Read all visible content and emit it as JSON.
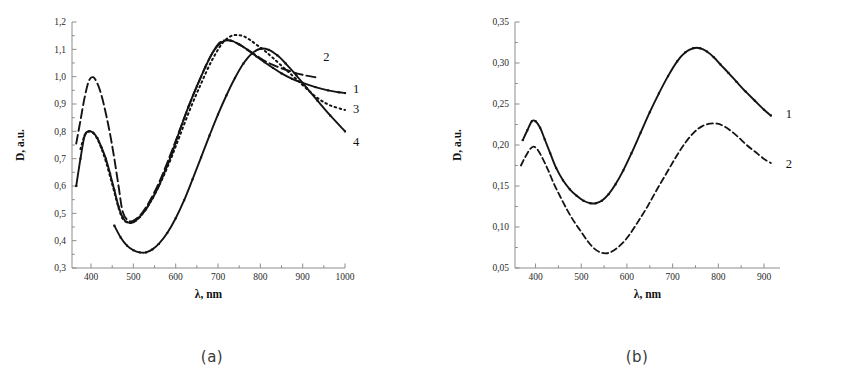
{
  "figure": {
    "panels": [
      {
        "caption": "(a)",
        "chart_data": {
          "type": "line",
          "title": "",
          "xlabel": "λ, nm",
          "ylabel": "D, a.u.",
          "xlim": [
            355,
            1000
          ],
          "ylim": [
            0.3,
            1.2
          ],
          "xticks": [
            400,
            500,
            600,
            700,
            800,
            900,
            1000
          ],
          "xticklabels": [
            "400",
            "500",
            "600",
            "700",
            "800",
            "900",
            "1000"
          ],
          "yticks": [
            0.3,
            0.4,
            0.5,
            0.6,
            0.7,
            0.8,
            0.9,
            1.0,
            1.1,
            1.2
          ],
          "yticklabels": [
            "0,3",
            "0,4",
            "0,5",
            "0,6",
            "0,7",
            "0,8",
            "0,9",
            "1,0",
            "1,1",
            "1,2"
          ],
          "grid": false,
          "legend_position": "right-of-curve-ends",
          "series": [
            {
              "name": "1",
              "label": "1",
              "style": "solid-markers",
              "label_x": 1000,
              "label_y": 0.955,
              "x": [
                365,
                375,
                385,
                395,
                405,
                415,
                425,
                435,
                445,
                455,
                465,
                475,
                485,
                500,
                515,
                530,
                545,
                560,
                575,
                590,
                610,
                630,
                650,
                670,
                690,
                710,
                730,
                750,
                770,
                790,
                810,
                830,
                850,
                875,
                900,
                930,
                960,
                985,
                1000
              ],
              "y": [
                0.6,
                0.7,
                0.785,
                0.8,
                0.795,
                0.775,
                0.74,
                0.7,
                0.645,
                0.585,
                0.525,
                0.485,
                0.468,
                0.468,
                0.487,
                0.515,
                0.555,
                0.6,
                0.655,
                0.715,
                0.805,
                0.89,
                0.965,
                1.035,
                1.095,
                1.127,
                1.132,
                1.118,
                1.098,
                1.075,
                1.053,
                1.032,
                1.012,
                0.992,
                0.977,
                0.962,
                0.95,
                0.943,
                0.94
              ]
            },
            {
              "name": "2",
              "label": "2",
              "style": "dashed-long",
              "label_x": 930,
              "label_y": 1.073,
              "x": [
                365,
                375,
                385,
                395,
                405,
                415,
                425,
                435,
                445,
                455,
                465,
                475,
                490,
                505,
                520,
                535,
                550,
                565,
                580,
                600,
                620,
                640,
                660,
                680,
                700,
                715,
                730,
                750,
                770,
                790,
                810,
                830,
                855,
                880,
                905,
                930
              ],
              "y": [
                0.755,
                0.84,
                0.925,
                0.985,
                0.998,
                0.975,
                0.93,
                0.865,
                0.79,
                0.7,
                0.6,
                0.505,
                0.472,
                0.478,
                0.5,
                0.535,
                0.578,
                0.628,
                0.685,
                0.765,
                0.848,
                0.928,
                1.0,
                1.068,
                1.118,
                1.133,
                1.132,
                1.118,
                1.098,
                1.078,
                1.058,
                1.043,
                1.028,
                1.015,
                1.005,
                0.998
              ]
            },
            {
              "name": "3",
              "label": "3",
              "style": "dotted",
              "label_x": 1000,
              "label_y": 0.885,
              "x": [
                375,
                385,
                395,
                405,
                415,
                425,
                435,
                445,
                455,
                465,
                475,
                490,
                505,
                520,
                535,
                550,
                570,
                590,
                610,
                635,
                660,
                685,
                710,
                730,
                745,
                760,
                775,
                790,
                810,
                830,
                855,
                880,
                905,
                935,
                965,
                1000
              ],
              "y": [
                0.735,
                0.785,
                0.8,
                0.795,
                0.772,
                0.735,
                0.69,
                0.635,
                0.578,
                0.52,
                0.48,
                0.465,
                0.472,
                0.495,
                0.528,
                0.568,
                0.632,
                0.705,
                0.785,
                0.885,
                0.975,
                1.058,
                1.122,
                1.148,
                1.152,
                1.148,
                1.135,
                1.118,
                1.095,
                1.068,
                1.033,
                0.998,
                0.962,
                0.922,
                0.895,
                0.878
              ]
            },
            {
              "name": "4",
              "label": "4",
              "style": "solid-markers",
              "label_x": 1000,
              "label_y": 0.762,
              "x": [
                455,
                470,
                485,
                500,
                515,
                530,
                545,
                560,
                580,
                600,
                620,
                640,
                660,
                680,
                700,
                720,
                740,
                760,
                780,
                800,
                820,
                840,
                860,
                885,
                910,
                935,
                965,
                1000
              ],
              "y": [
                0.455,
                0.412,
                0.382,
                0.365,
                0.357,
                0.357,
                0.368,
                0.388,
                0.428,
                0.482,
                0.548,
                0.625,
                0.705,
                0.785,
                0.862,
                0.932,
                0.995,
                1.048,
                1.085,
                1.102,
                1.098,
                1.078,
                1.048,
                1.005,
                0.958,
                0.912,
                0.858,
                0.8
              ]
            }
          ]
        }
      },
      {
        "caption": "(b)",
        "chart_data": {
          "type": "line",
          "title": "",
          "xlabel": "λ, nm",
          "ylabel": "D, a.u.",
          "xlim": [
            355,
            935
          ],
          "ylim": [
            0.05,
            0.35
          ],
          "xticks": [
            400,
            500,
            600,
            700,
            800,
            900
          ],
          "xticklabels": [
            "400",
            "500",
            "600",
            "700",
            "800",
            "900"
          ],
          "yticks": [
            0.05,
            0.1,
            0.15,
            0.2,
            0.25,
            0.3,
            0.35
          ],
          "yticklabels": [
            "0,05",
            "0,10",
            "0,15",
            "0,20",
            "0,25",
            "0,30",
            "0,35"
          ],
          "grid": false,
          "legend_position": "right-of-curve-ends",
          "series": [
            {
              "name": "1",
              "label": "1",
              "style": "solid-markers",
              "label_x": 930,
              "label_y": 0.239,
              "x": [
                372,
                382,
                392,
                400,
                410,
                420,
                432,
                445,
                460,
                475,
                490,
                505,
                520,
                532,
                545,
                560,
                575,
                592,
                610,
                630,
                650,
                670,
                690,
                710,
                728,
                745,
                760,
                775,
                790,
                805,
                822,
                840,
                860,
                880,
                900,
                915
              ],
              "y": [
                0.206,
                0.218,
                0.229,
                0.229,
                0.221,
                0.207,
                0.19,
                0.172,
                0.157,
                0.146,
                0.138,
                0.132,
                0.129,
                0.129,
                0.132,
                0.14,
                0.152,
                0.169,
                0.19,
                0.215,
                0.24,
                0.263,
                0.284,
                0.302,
                0.313,
                0.318,
                0.318,
                0.314,
                0.307,
                0.298,
                0.288,
                0.277,
                0.265,
                0.254,
                0.243,
                0.236
              ]
            },
            {
              "name": "2",
              "label": "2",
              "style": "dashed",
              "label_x": 930,
              "label_y": 0.178,
              "x": [
                368,
                378,
                388,
                396,
                405,
                415,
                427,
                440,
                455,
                470,
                485,
                500,
                515,
                528,
                542,
                556,
                570,
                588,
                606,
                626,
                646,
                666,
                688,
                708,
                728,
                748,
                765,
                782,
                798,
                812,
                828,
                845,
                862,
                880,
                900,
                915
              ],
              "y": [
                0.175,
                0.186,
                0.195,
                0.198,
                0.194,
                0.184,
                0.17,
                0.153,
                0.136,
                0.12,
                0.106,
                0.094,
                0.082,
                0.074,
                0.069,
                0.068,
                0.071,
                0.079,
                0.091,
                0.108,
                0.126,
                0.146,
                0.167,
                0.186,
                0.203,
                0.216,
                0.223,
                0.226,
                0.226,
                0.223,
                0.217,
                0.209,
                0.2,
                0.192,
                0.183,
                0.178
              ]
            }
          ]
        }
      }
    ]
  }
}
